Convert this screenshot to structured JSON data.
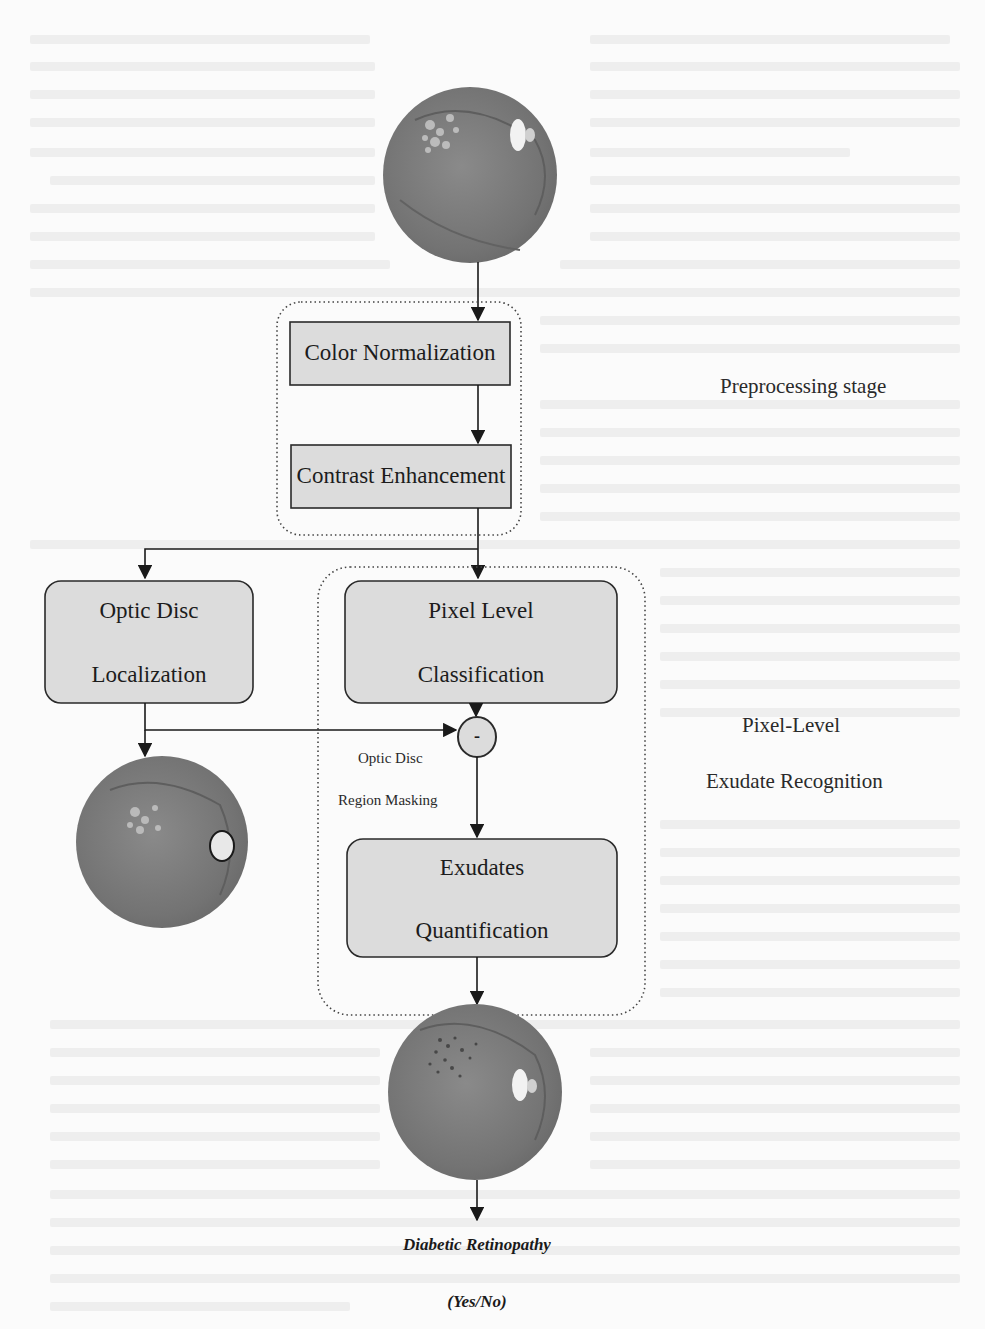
{
  "diagram": {
    "nodes": {
      "input_image": {
        "label": "Retinal fundus image (input)",
        "icon": "fundus-image-icon"
      },
      "color_normalization": {
        "label": "Color Normalization"
      },
      "contrast_enhancement": {
        "label": "Contrast Enhancement"
      },
      "optic_disc_localization": {
        "line1": "Optic Disc",
        "line2": "Localization"
      },
      "optic_disc_image": {
        "label": "Fundus image with localized optic disc",
        "icon": "fundus-image-icon"
      },
      "pixel_level_classification": {
        "line1": "Pixel Level",
        "line2": "Classification"
      },
      "subtract_operator": {
        "symbol": "-"
      },
      "optic_disc_region_masking": {
        "line1": "Optic Disc",
        "line2": "Region Masking"
      },
      "exudates_quantification": {
        "line1": "Exudates",
        "line2": "Quantification"
      },
      "exudates_image": {
        "label": "Fundus image with detected exudates",
        "icon": "fundus-image-icon"
      },
      "output": {
        "line1": "Diabetic Retinopathy",
        "line2": "(Yes/No)"
      }
    },
    "groups": {
      "preprocessing": {
        "label": "Preprocessing stage"
      },
      "pixel_level": {
        "line1": "Pixel-Level",
        "line2": "Exudate Recognition"
      }
    },
    "edges": [
      {
        "from": "input_image",
        "to": "color_normalization"
      },
      {
        "from": "color_normalization",
        "to": "contrast_enhancement"
      },
      {
        "from": "contrast_enhancement",
        "to": "optic_disc_localization"
      },
      {
        "from": "contrast_enhancement",
        "to": "pixel_level_classification"
      },
      {
        "from": "optic_disc_localization",
        "to": "optic_disc_image"
      },
      {
        "from": "optic_disc_localization",
        "to": "subtract_operator"
      },
      {
        "from": "pixel_level_classification",
        "to": "subtract_operator"
      },
      {
        "from": "subtract_operator",
        "to": "exudates_quantification"
      },
      {
        "from": "exudates_quantification",
        "to": "exudates_image"
      },
      {
        "from": "exudates_image",
        "to": "output"
      }
    ],
    "colors": {
      "box_fill": "#dcdcdc",
      "box_stroke": "#2a2a2a",
      "fundus": "#7a7a7a",
      "background": "#fbfbfb"
    }
  }
}
